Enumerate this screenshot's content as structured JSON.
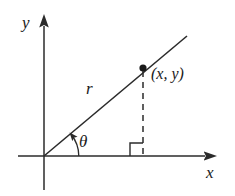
{
  "figure": {
    "name": "polar-coordinates-right-triangle-diagram",
    "type": "geometry-diagram",
    "background_color": "#ffffff",
    "stroke_color": "#2b2b2b",
    "text_color": "#1a1a1a"
  },
  "axes": {
    "y_axis_label": "y",
    "x_axis_label": "x",
    "origin": {
      "x": 44,
      "y": 156
    },
    "x_axis": {
      "start_x": 18,
      "end_x": 213,
      "y": 156,
      "arrow": "right"
    },
    "y_axis": {
      "x": 44,
      "start_y": 190,
      "end_y": 18,
      "arrow": "up"
    }
  },
  "labels": {
    "radius": "r",
    "angle": "θ",
    "point": "(x, y)"
  },
  "geometry": {
    "ray": {
      "from_x": 44,
      "from_y": 156,
      "to_x": 187,
      "to_y": 36
    },
    "point_marker": {
      "x": 143,
      "y": 68,
      "radius": 3.6,
      "fill": "#1a1a1a"
    },
    "dashed_drop_line": {
      "x": 143,
      "from_y": 71,
      "to_y": 156
    },
    "right_angle_marker": {
      "x": 130,
      "y": 143,
      "size": 13
    },
    "angle_arc": {
      "center_x": 44,
      "center_y": 156,
      "radius": 34,
      "start_deg": 0,
      "end_deg": 40
    }
  }
}
